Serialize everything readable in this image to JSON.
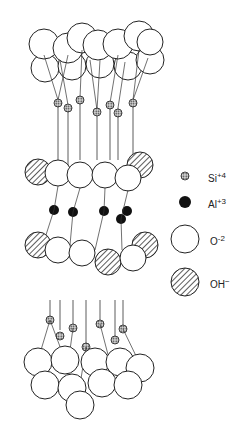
{
  "legend": {
    "items": [
      {
        "key": "si",
        "symbol": "Si",
        "charge": "+4",
        "style": "dotted-small",
        "icon": "silicon-atom-icon"
      },
      {
        "key": "al",
        "symbol": "Al",
        "charge": "+3",
        "style": "solid-black",
        "icon": "aluminum-atom-icon"
      },
      {
        "key": "o",
        "symbol": "O",
        "charge": "-2",
        "style": "open-large",
        "icon": "oxygen-atom-icon"
      },
      {
        "key": "oh",
        "symbol": "OH",
        "charge": "−",
        "style": "hatched-large",
        "icon": "hydroxyl-icon"
      }
    ]
  },
  "colors": {
    "line": "#222222",
    "fill": "#ffffff",
    "dark": "#111111"
  }
}
